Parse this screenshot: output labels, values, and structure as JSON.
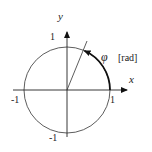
{
  "diagram": {
    "axes": {
      "x_label": "x",
      "y_label": "y"
    },
    "ticks": {
      "x_pos": "1",
      "x_neg": "-1",
      "y_pos": "1",
      "y_neg": "-1"
    },
    "angle": {
      "symbol": "φ",
      "unit": "[rad]"
    },
    "colors": {
      "stroke": "#222222",
      "background": "#ffffff"
    }
  }
}
